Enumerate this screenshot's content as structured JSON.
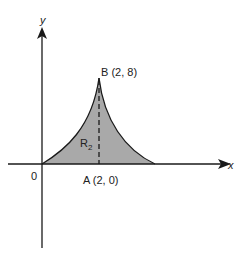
{
  "figure": {
    "axes": {
      "x_label": "x",
      "y_label": "y",
      "origin_label": "0"
    },
    "points": {
      "A": "A (2, 0)",
      "B": "B (2, 8)"
    },
    "region": {
      "label_main": "R",
      "label_sub": "2",
      "fill_color": "#a9a9a9"
    },
    "colors": {
      "line": "#1a1a1a",
      "background": "#ffffff"
    }
  }
}
